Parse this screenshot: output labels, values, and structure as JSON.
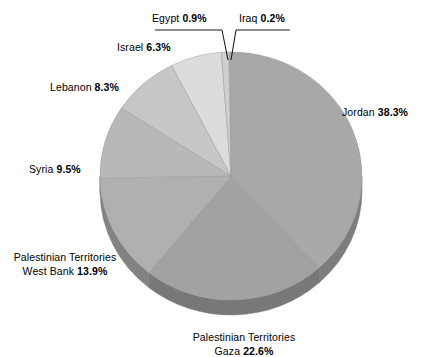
{
  "chart_data": {
    "type": "pie",
    "title": "",
    "subtitle": "",
    "xlabel": "",
    "ylabel": "",
    "legend_position": "none",
    "grid": false,
    "style": "3d-pie",
    "units": "percent",
    "start_angle_deg": -1,
    "direction": "clockwise",
    "categories": [
      "Iraq",
      "Jordan",
      "Palestinian Territories Gaza",
      "Palestinian Territories West Bank",
      "Syria",
      "Lebanon",
      "Israel",
      "Egypt"
    ],
    "values": [
      0.2,
      38.3,
      22.6,
      13.9,
      9.5,
      8.3,
      6.3,
      0.9
    ],
    "total": 100.0,
    "slices": [
      {
        "name": "Iraq",
        "value": 0.2,
        "label": "Iraq 0.2%",
        "color": "#b3b3b3",
        "side_color": "#8c8c8c"
      },
      {
        "name": "Jordan",
        "value": 38.3,
        "label": "Jordan 38.3%",
        "color": "#a8a8a8",
        "side_color": "#7d7d7d"
      },
      {
        "name": "Palestinian Territories Gaza",
        "value": 22.6,
        "label": "Palestinian Territories Gaza 22.6%",
        "color": "#a2a2a2",
        "side_color": "#787878"
      },
      {
        "name": "Palestinian Territories West Bank",
        "value": 13.9,
        "label": "Palestinian Territories West Bank 13.9%",
        "color": "#b0b0b0",
        "side_color": "#828282"
      },
      {
        "name": "Syria",
        "value": 9.5,
        "label": "Syria 9.5%",
        "color": "#b8b8b8",
        "side_color": "#8a8a8a"
      },
      {
        "name": "Lebanon",
        "value": 8.3,
        "label": "Lebanon 8.3%",
        "color": "#c6c6c6",
        "side_color": "#8f8f8f"
      },
      {
        "name": "Israel",
        "value": 6.3,
        "label": "Israel 6.3%",
        "color": "#dcdcdc",
        "side_color": "#9a9a9a"
      },
      {
        "name": "Egypt",
        "value": 0.9,
        "label": "Egypt 0.9%",
        "color": "#cfcfcf",
        "side_color": "#949494"
      }
    ]
  },
  "labels": {
    "egypt": {
      "name": "Egypt",
      "pct": "0.9%"
    },
    "iraq": {
      "name": "Iraq",
      "pct": "0.2%"
    },
    "israel": {
      "name": "Israel",
      "pct": "6.3%"
    },
    "lebanon": {
      "name": "Lebanon",
      "pct": "8.3%"
    },
    "jordan": {
      "name": "Jordan",
      "pct": "38.3%"
    },
    "syria": {
      "name": "Syria",
      "pct": "9.5%"
    },
    "west_bank": {
      "line1": "Palestinian Territories",
      "name": "West Bank",
      "pct": "13.9%"
    },
    "gaza": {
      "line1": "Palestinian Territories",
      "name": "Gaza",
      "pct": "22.6%"
    }
  },
  "colors": {
    "background": "#ffffff",
    "text": "#000000",
    "leader_line": "#1a1a1a",
    "pie_base_dark": "#7a7a7a"
  }
}
